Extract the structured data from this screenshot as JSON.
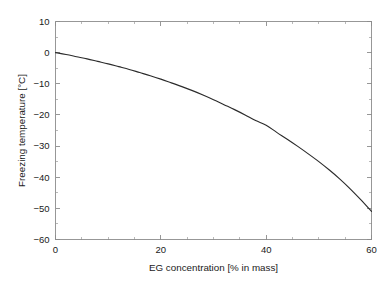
{
  "chart_data": {
    "type": "line",
    "title": "",
    "subtitle": "",
    "xlabel": "EG concentration [% in mass]",
    "ylabel": "Freezing temperature [°C]",
    "xlim": [
      0,
      60
    ],
    "ylim": [
      -60,
      10
    ],
    "grid": false,
    "legend": null,
    "legend_position": "none",
    "x_major_ticks": [
      0,
      20,
      40,
      60
    ],
    "x_major_tick_labels": [
      "0",
      "20",
      "40",
      "60"
    ],
    "x_minor_tick_step": 5,
    "y_major_ticks": [
      10,
      0,
      -10,
      -20,
      -30,
      -40,
      -50,
      -60
    ],
    "y_major_tick_labels": [
      "10",
      "0",
      "−10",
      "−20",
      "−30",
      "−40",
      "−50",
      "−60"
    ],
    "y_minor_tick_step": 5,
    "series": [
      {
        "name": "Freezing temperature of EG/water mixture",
        "color": "#2b2b2b",
        "x": [
          0,
          2,
          4,
          6,
          8,
          10,
          12,
          14,
          16,
          18,
          20,
          22,
          24,
          26,
          28,
          30,
          32,
          34,
          36,
          38,
          40,
          42,
          44,
          46,
          48,
          50,
          52,
          54,
          56,
          58,
          60
        ],
        "values": [
          0.0,
          -0.6,
          -1.3,
          -2.0,
          -2.8,
          -3.6,
          -4.5,
          -5.4,
          -6.4,
          -7.4,
          -8.5,
          -9.7,
          -10.9,
          -12.2,
          -13.6,
          -15.1,
          -16.7,
          -18.3,
          -20.0,
          -21.8,
          -23.3,
          -25.6,
          -27.8,
          -30.1,
          -32.5,
          -35.0,
          -37.7,
          -40.6,
          -43.8,
          -47.3,
          -51.0
        ]
      }
    ]
  },
  "figure": {
    "background_color": "#ffffff",
    "axis_color": "#8c8c8c",
    "text_color": "#1a1a1a"
  }
}
